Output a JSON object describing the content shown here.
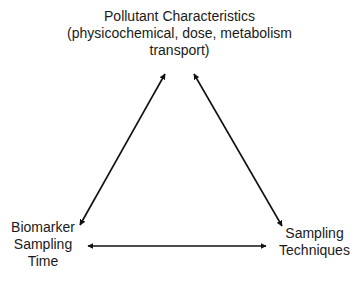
{
  "diagram": {
    "type": "triangle-relationship",
    "nodes": {
      "top": {
        "lines": [
          "Pollutant  Characteristics",
          "(physicochemical,  dose, metabolism",
          "transport)"
        ]
      },
      "left": {
        "lines": [
          "Biomarker",
          "Sampling",
          "Time"
        ]
      },
      "right": {
        "lines": [
          "Sampling",
          "Techniques"
        ]
      }
    },
    "edges": [
      {
        "from": "top",
        "to": "left",
        "style": "double-arrow"
      },
      {
        "from": "top",
        "to": "right",
        "style": "double-arrow"
      },
      {
        "from": "left",
        "to": "right",
        "style": "double-arrow"
      }
    ],
    "colors": {
      "text": "#1a1a1a",
      "arrow": "#111111",
      "background": "#ffffff"
    }
  }
}
